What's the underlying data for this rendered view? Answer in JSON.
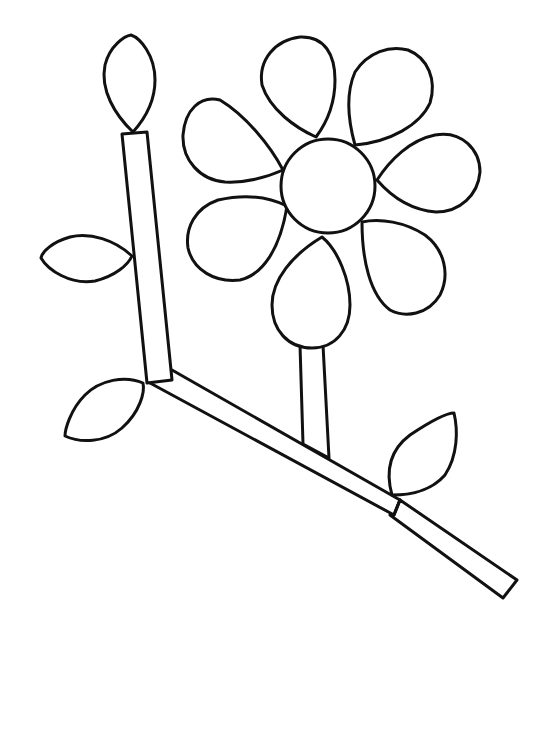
{
  "drawing": {
    "subject": "flower-coloring-page",
    "background": "#ffffff",
    "ink_color": "#111111",
    "flower": {
      "petal_count": 7,
      "center": "circle"
    },
    "leaves": 4,
    "bud": 1
  }
}
